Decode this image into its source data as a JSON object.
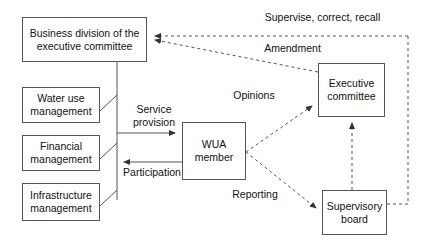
{
  "diagram": {
    "background_color": "#ffffff",
    "line_color": "#555555",
    "text_color": "#111111",
    "nodes": [
      {
        "id": "business-division",
        "label": "Business division of the\nexecutive committee",
        "x": 22,
        "y": 17,
        "w": 125,
        "h": 45
      },
      {
        "id": "water-use-management",
        "label": "Water use\nmanagement",
        "x": 22,
        "y": 87,
        "w": 78,
        "h": 36
      },
      {
        "id": "financial-management",
        "label": "Financial\nmanagement",
        "x": 22,
        "y": 135,
        "w": 78,
        "h": 36
      },
      {
        "id": "infrastructure-management",
        "label": "Infrastructure\nmanagement",
        "x": 22,
        "y": 183,
        "w": 78,
        "h": 38
      },
      {
        "id": "wua-member",
        "label": "WUA\nmember",
        "x": 182,
        "y": 122,
        "w": 64,
        "h": 58
      },
      {
        "id": "executive-committee",
        "label": "Executive\ncommittee",
        "x": 318,
        "y": 63,
        "w": 67,
        "h": 54
      },
      {
        "id": "supervisory-board",
        "label": "Supervisory\nboard",
        "x": 322,
        "y": 190,
        "w": 65,
        "h": 45
      }
    ],
    "edge_labels": [
      {
        "id": "service-provision",
        "text": "Service\nprovision",
        "x": 125,
        "y": 103,
        "w": 56
      },
      {
        "id": "participation",
        "text": "Participation",
        "x": 118,
        "y": 166,
        "w": 66
      },
      {
        "id": "opinions",
        "text": "Opinions",
        "x": 228,
        "y": 89,
        "w": 50
      },
      {
        "id": "reporting",
        "text": "Reporting",
        "x": 228,
        "y": 188,
        "w": 52
      },
      {
        "id": "supervise-correct-recall",
        "text": "Supervise, correct, recall",
        "x": 258,
        "y": 11,
        "w": 127
      },
      {
        "id": "amendment",
        "text": "Amendment",
        "x": 258,
        "y": 42,
        "w": 67
      }
    ]
  }
}
